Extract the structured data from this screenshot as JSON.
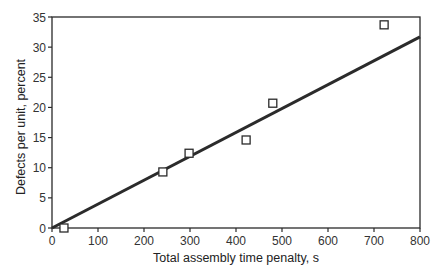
{
  "chart_data": {
    "type": "scatter",
    "title": "",
    "xlabel": "Total assembly time penalty, s",
    "ylabel": "Defects per unit, percent",
    "xlim": [
      0,
      800
    ],
    "ylim": [
      0,
      35
    ],
    "xticks": [
      0,
      100,
      200,
      300,
      400,
      500,
      600,
      700,
      800
    ],
    "yticks": [
      0,
      5,
      10,
      15,
      20,
      25,
      30,
      35
    ],
    "grid": false,
    "legend": null,
    "series": [
      {
        "name": "Observed",
        "marker": "open-square",
        "points": [
          {
            "x": 26,
            "y": 0.0
          },
          {
            "x": 241,
            "y": 9.3
          },
          {
            "x": 298,
            "y": 12.4
          },
          {
            "x": 422,
            "y": 14.6
          },
          {
            "x": 480,
            "y": 20.7
          },
          {
            "x": 722,
            "y": 33.7
          }
        ]
      },
      {
        "name": "Linear fit",
        "style": "line",
        "points": [
          {
            "x": 0,
            "y": 0.0
          },
          {
            "x": 800,
            "y": 31.7
          }
        ]
      }
    ]
  }
}
